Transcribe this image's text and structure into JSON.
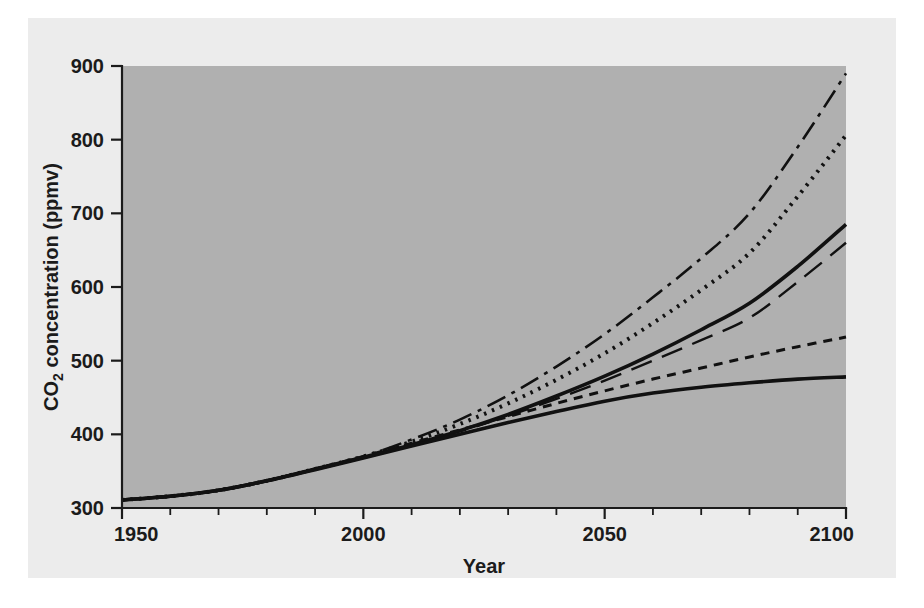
{
  "figure": {
    "panel_background": "#ececec",
    "plot_background": "#b0b0b0",
    "page_background": "#ffffff",
    "ink_color": "#111111"
  },
  "chart_data": {
    "type": "line",
    "title": "",
    "subtitle": "",
    "xlabel": "Year",
    "ylabel": "CO2 concentration (ppmv)",
    "ylabel_parts": {
      "prefix": "CO",
      "subscript": "2",
      "suffix": " concentration (ppmv)"
    },
    "xlim": [
      1950,
      2100
    ],
    "ylim": [
      300,
      900
    ],
    "xticks": [
      1950,
      2000,
      2050,
      2100
    ],
    "xtick_labels": [
      "1950",
      "2000",
      "2050",
      "2100"
    ],
    "xminor_step": 10,
    "yticks": [
      300,
      400,
      500,
      600,
      700,
      800,
      900
    ],
    "ytick_labels": [
      "300",
      "400",
      "500",
      "600",
      "700",
      "800",
      "900"
    ],
    "grid": false,
    "legend": "none",
    "x": [
      1950,
      1960,
      1970,
      1980,
      1990,
      2000,
      2010,
      2020,
      2030,
      2040,
      2050,
      2060,
      2070,
      2080,
      2090,
      2100
    ],
    "series": [
      {
        "name": "scenario-dash-dot",
        "style": "dash-dot",
        "dasharray": "20 7 4 7",
        "width": 2.6,
        "values": [
          311,
          316,
          324,
          337,
          353,
          370,
          393,
          420,
          453,
          492,
          536,
          586,
          639,
          700,
          790,
          890
        ]
      },
      {
        "name": "scenario-dotted",
        "style": "dotted",
        "dasharray": "2.5 6",
        "width": 4.0,
        "values": [
          311,
          316,
          324,
          337,
          353,
          370,
          390,
          414,
          442,
          474,
          510,
          551,
          596,
          646,
          723,
          806
        ]
      },
      {
        "name": "scenario-solid-upper",
        "style": "solid",
        "dasharray": "none",
        "width": 3.6,
        "values": [
          311,
          316,
          324,
          337,
          353,
          369,
          386,
          405,
          427,
          452,
          479,
          509,
          542,
          578,
          628,
          685
        ]
      },
      {
        "name": "scenario-long-dash",
        "style": "long-dash",
        "dasharray": "22 11",
        "width": 2.4,
        "values": [
          311,
          316,
          324,
          337,
          352,
          368,
          385,
          404,
          425,
          448,
          473,
          500,
          528,
          558,
          607,
          660
        ]
      },
      {
        "name": "scenario-short-dash",
        "style": "short-dash",
        "dasharray": "9 7",
        "width": 3.0,
        "values": [
          311,
          316,
          324,
          337,
          353,
          370,
          388,
          406,
          424,
          442,
          459,
          475,
          490,
          505,
          519,
          532
        ]
      },
      {
        "name": "scenario-solid-lower",
        "style": "solid",
        "dasharray": "none",
        "width": 3.6,
        "values": [
          311,
          316,
          324,
          337,
          352,
          368,
          384,
          400,
          416,
          431,
          445,
          456,
          464,
          470,
          475,
          478
        ]
      }
    ]
  }
}
